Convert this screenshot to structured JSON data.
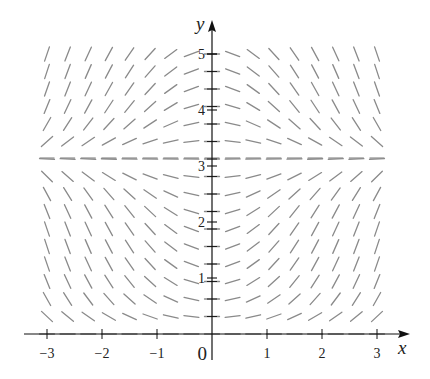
{
  "chart_data": {
    "type": "slope-field",
    "title": "",
    "equation": "dy/dx = x sin(y)",
    "xlabel": "x",
    "ylabel": "y",
    "xlim": [
      -3,
      3
    ],
    "ylim": [
      0,
      5
    ],
    "x_ticks": [
      -3,
      -2,
      -1,
      1,
      2,
      3
    ],
    "x_tick_labels": [
      "−3",
      "−2",
      "−1",
      "1",
      "2",
      "3"
    ],
    "y_ticks": [
      1,
      2,
      3,
      4,
      5
    ],
    "y_tick_labels": [
      "1",
      "2",
      "3",
      "4",
      "5"
    ],
    "origin_label": "0",
    "grid": {
      "x_start": -3,
      "x_step": 0.375,
      "x_count": 17,
      "y_start": 0,
      "y_step": 0.3125,
      "y_count": 17
    },
    "equilibrium_lines": [
      0,
      3.14159
    ],
    "segment_color": "#8a8a8a",
    "axis_color": "#111111"
  }
}
